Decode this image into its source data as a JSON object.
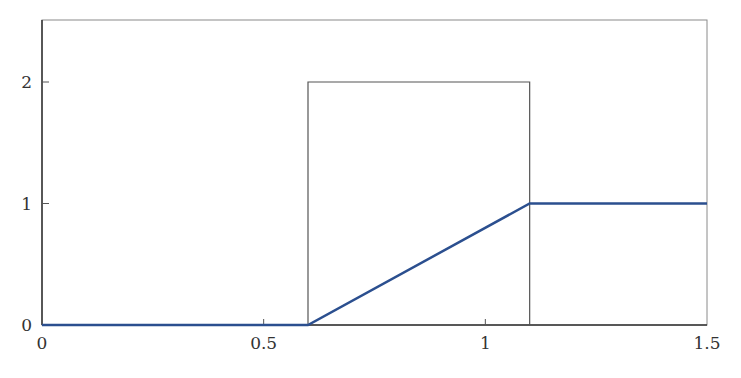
{
  "chart_data": {
    "type": "line",
    "title": "",
    "xlabel": "",
    "ylabel": "",
    "xlim": [
      0,
      1.5
    ],
    "ylim": [
      0,
      2.5
    ],
    "grid": false,
    "legend": null,
    "x_ticks": [
      {
        "value": 0,
        "label": "0"
      },
      {
        "value": 0.5,
        "label": "0.5"
      },
      {
        "value": 1,
        "label": "1"
      },
      {
        "value": 1.5,
        "label": "1.5"
      }
    ],
    "y_ticks": [
      {
        "value": 0,
        "label": "0"
      },
      {
        "value": 1,
        "label": "1"
      },
      {
        "value": 2,
        "label": "2"
      }
    ],
    "series": [
      {
        "name": "ramp",
        "color": "#2b4f8f",
        "x": [
          0,
          0.6,
          1.1,
          1.5
        ],
        "y": [
          0,
          0,
          1,
          1
        ]
      },
      {
        "name": "rectangular-pulse",
        "color": "#555555",
        "x": [
          0.6,
          0.6,
          1.1,
          1.1
        ],
        "y": [
          0,
          2,
          2,
          0
        ]
      }
    ]
  }
}
